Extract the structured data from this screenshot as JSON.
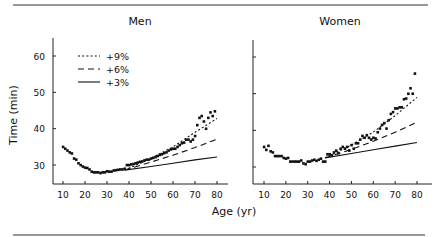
{
  "chart_data": [
    {
      "type": "scatter",
      "title": "Men",
      "xlabel": "Age (yr)",
      "ylabel": "Time (min)",
      "xlim": [
        5,
        85
      ],
      "ylim": [
        25,
        65
      ],
      "xticks": [
        10,
        20,
        30,
        40,
        50,
        60,
        70,
        80
      ],
      "yticks": [
        30,
        40,
        50,
        60
      ],
      "legend": [
        {
          "label": "+9%",
          "style": "dotted"
        },
        {
          "label": "+6%",
          "style": "dashed"
        },
        {
          "label": "+3%",
          "style": "solid"
        }
      ],
      "points": [
        [
          10,
          35
        ],
        [
          11,
          34.5
        ],
        [
          12,
          34
        ],
        [
          13,
          33.5
        ],
        [
          14,
          33.2
        ],
        [
          15,
          31.8
        ],
        [
          16,
          31.5
        ],
        [
          17,
          30.5
        ],
        [
          18,
          30
        ],
        [
          19,
          29.6
        ],
        [
          20,
          29.3
        ],
        [
          21,
          29.2
        ],
        [
          22,
          28.8
        ],
        [
          23,
          28.2
        ],
        [
          24,
          28
        ],
        [
          25,
          28
        ],
        [
          26,
          28
        ],
        [
          27,
          27.8
        ],
        [
          28,
          28
        ],
        [
          29,
          28
        ],
        [
          30,
          28.3
        ],
        [
          31,
          28.2
        ],
        [
          32,
          28.2
        ],
        [
          33,
          28.5
        ],
        [
          34,
          28.6
        ],
        [
          35,
          28.7
        ],
        [
          36,
          28.8
        ],
        [
          37,
          28.8
        ],
        [
          38,
          29
        ],
        [
          39,
          30
        ],
        [
          40,
          30
        ],
        [
          41,
          30.2
        ],
        [
          42,
          30.3
        ],
        [
          43,
          30.5
        ],
        [
          44,
          30.7
        ],
        [
          45,
          30.9
        ],
        [
          46,
          31
        ],
        [
          47,
          31.3
        ],
        [
          48,
          31.5
        ],
        [
          49,
          31.5
        ],
        [
          50,
          31.8
        ],
        [
          51,
          32
        ],
        [
          52,
          32.2
        ],
        [
          53,
          32.5
        ],
        [
          54,
          32.8
        ],
        [
          55,
          33
        ],
        [
          56,
          33.3
        ],
        [
          57,
          33.5
        ],
        [
          58,
          34
        ],
        [
          59,
          34.3
        ],
        [
          60,
          34.5
        ],
        [
          61,
          34.5
        ],
        [
          62,
          35
        ],
        [
          63,
          35.5
        ],
        [
          64,
          36
        ],
        [
          65,
          36.2
        ],
        [
          66,
          37
        ],
        [
          67,
          37
        ],
        [
          68,
          36.5
        ],
        [
          69,
          37
        ],
        [
          70,
          38
        ],
        [
          71,
          41
        ],
        [
          72,
          43
        ],
        [
          73,
          43.5
        ],
        [
          74,
          42
        ],
        [
          75,
          40
        ],
        [
          76,
          43
        ],
        [
          77,
          44.5
        ],
        [
          78,
          43.5
        ],
        [
          79,
          44.8
        ]
      ],
      "curves": [
        {
          "label": "+9%",
          "x": [
            38,
            50,
            60,
            70,
            80
          ],
          "y": [
            28.6,
            31.8,
            35,
            39,
            42.8
          ]
        },
        {
          "label": "+6%",
          "x": [
            38,
            50,
            60,
            70,
            80
          ],
          "y": [
            28.6,
            30.8,
            32.7,
            34.8,
            37.1
          ]
        },
        {
          "label": "+3%",
          "x": [
            38,
            50,
            60,
            70,
            80
          ],
          "y": [
            28.6,
            29.6,
            30.5,
            31.4,
            32.2
          ]
        }
      ]
    },
    {
      "type": "scatter",
      "title": "Women",
      "xlabel": "Age (yr)",
      "ylabel": "Time (min)",
      "xlim": [
        5,
        85
      ],
      "ylim": [
        25,
        65
      ],
      "xticks": [
        10,
        20,
        30,
        40,
        50,
        60,
        70,
        80
      ],
      "yticks": [
        30,
        40,
        50,
        60
      ],
      "points": [
        [
          10,
          35.5
        ],
        [
          11,
          34.7
        ],
        [
          12,
          35.8
        ],
        [
          13,
          34.3
        ],
        [
          14,
          34
        ],
        [
          15,
          33
        ],
        [
          16,
          33
        ],
        [
          17,
          33
        ],
        [
          18,
          33
        ],
        [
          19,
          32.5
        ],
        [
          20,
          32.3
        ],
        [
          21,
          32.5
        ],
        [
          22,
          31.5
        ],
        [
          23,
          31.5
        ],
        [
          24,
          31.5
        ],
        [
          25,
          31.5
        ],
        [
          26,
          31.5
        ],
        [
          27,
          31.8
        ],
        [
          28,
          31
        ],
        [
          29,
          30.8
        ],
        [
          30,
          31.5
        ],
        [
          31,
          31.5
        ],
        [
          32,
          31.8
        ],
        [
          33,
          32
        ],
        [
          34,
          31.7
        ],
        [
          35,
          32
        ],
        [
          36,
          32.3
        ],
        [
          37,
          31.5
        ],
        [
          38,
          31.5
        ],
        [
          39,
          33.5
        ],
        [
          40,
          33.5
        ],
        [
          41,
          33.2
        ],
        [
          42,
          34
        ],
        [
          43,
          34.5
        ],
        [
          44,
          33.8
        ],
        [
          45,
          35
        ],
        [
          46,
          35.5
        ],
        [
          47,
          35
        ],
        [
          48,
          35.5
        ],
        [
          49,
          34.5
        ],
        [
          50,
          36
        ],
        [
          51,
          35
        ],
        [
          52,
          36.5
        ],
        [
          53,
          36.5
        ],
        [
          54,
          37.5
        ],
        [
          55,
          38.5
        ],
        [
          56,
          38
        ],
        [
          57,
          38.7
        ],
        [
          58,
          38
        ],
        [
          59,
          37.5
        ],
        [
          60,
          38
        ],
        [
          61,
          37.8
        ],
        [
          62,
          39.5
        ],
        [
          63,
          40.5
        ],
        [
          64,
          41.5
        ],
        [
          65,
          42
        ],
        [
          66,
          40.5
        ],
        [
          67,
          42.8
        ],
        [
          68,
          44.5
        ],
        [
          69,
          45
        ],
        [
          70,
          46
        ],
        [
          71,
          46
        ],
        [
          72,
          46.3
        ],
        [
          73,
          46.3
        ],
        [
          74,
          48.5
        ],
        [
          75,
          48.7
        ],
        [
          76,
          50
        ],
        [
          77,
          51.5
        ],
        [
          78,
          50
        ],
        [
          79,
          55.5
        ]
      ],
      "curves": [
        {
          "label": "+9%",
          "x": [
            38,
            50,
            60,
            70,
            80
          ],
          "y": [
            32.5,
            36,
            39.5,
            44,
            49
          ]
        },
        {
          "label": "+6%",
          "x": [
            38,
            50,
            60,
            70,
            80
          ],
          "y": [
            32.5,
            34.8,
            37,
            39.5,
            42.2
          ]
        },
        {
          "label": "+3%",
          "x": [
            38,
            50,
            60,
            70,
            80
          ],
          "y": [
            32.5,
            33.7,
            34.7,
            35.7,
            36.7
          ]
        }
      ]
    }
  ]
}
